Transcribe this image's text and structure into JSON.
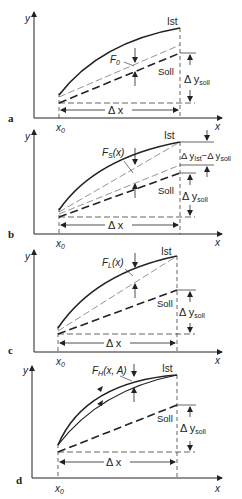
{
  "figure": {
    "panels": [
      {
        "letter": "a",
        "ist_label": "Ist",
        "soll_label": "Soll",
        "error_label": "F",
        "error_sub": "0",
        "error_arg": "",
        "dx_label": "Δ x",
        "dy_label": "Δ y",
        "dy_sub": "soll",
        "x0_label": "x",
        "x0_sub": "0",
        "x_axis": "x",
        "y_axis": "y"
      },
      {
        "letter": "b",
        "ist_label": "Ist",
        "soll_label": "Soll",
        "error_label": "F",
        "error_sub": "S",
        "error_arg": "(x)",
        "dx_label": "Δ x",
        "dy_label": "Δ y",
        "dy_sub": "soll",
        "diff_label": "Δ y",
        "diff_sub1": "Ist",
        "diff_mid": "−Δ y",
        "diff_sub2": "soll",
        "x0_label": "x",
        "x0_sub": "0",
        "x_axis": "x",
        "y_axis": "y"
      },
      {
        "letter": "c",
        "ist_label": "Ist",
        "soll_label": "Soll",
        "error_label": "F",
        "error_sub": "L",
        "error_arg": "(x)",
        "dx_label": "Δ x",
        "dy_label": "Δ y",
        "dy_sub": "soll",
        "x0_label": "x",
        "x0_sub": "0",
        "x_axis": "x",
        "y_axis": "y"
      },
      {
        "letter": "d",
        "ist_label": "Ist",
        "soll_label": "Soll",
        "error_label": "F",
        "error_sub": "H",
        "error_arg": "(x, A)",
        "dx_label": "Δ x",
        "dy_label": "Δ y",
        "dy_sub": "soll",
        "x0_label": "x",
        "x0_sub": "0",
        "x_axis": "x",
        "y_axis": "y"
      }
    ]
  }
}
